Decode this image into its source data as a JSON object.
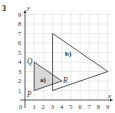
{
  "question_number": "3",
  "axes": {
    "x_label": "x",
    "y_label": "y",
    "origin_label": "0",
    "x_ticks": [
      "1",
      "2",
      "3",
      "4",
      "5",
      "6",
      "7",
      "8",
      "9"
    ],
    "y_ticks": [
      "1",
      "2",
      "3",
      "4",
      "5",
      "6",
      "7",
      "8",
      "9"
    ],
    "x_range": [
      0,
      9
    ],
    "y_range": [
      0,
      9
    ]
  },
  "shapes": [
    {
      "label": "a)",
      "vertices": [
        {
          "name": "P",
          "x": 1,
          "y": 1
        },
        {
          "name": "Q",
          "x": 1,
          "y": 4
        },
        {
          "name": "R",
          "x": 4,
          "y": 2
        }
      ],
      "fill": "#d9d9d9",
      "stroke": "#333333"
    },
    {
      "label": "b)",
      "vertices": [
        {
          "x": 3,
          "y": 1
        },
        {
          "x": 3,
          "y": 7
        },
        {
          "x": 9,
          "y": 3
        }
      ],
      "fill": "none",
      "stroke": "#333333"
    }
  ],
  "point_labels": {
    "P": "P",
    "Q": "Q",
    "R": "R"
  },
  "colors": {
    "grid": "#cfcfcf",
    "axis": "#333333",
    "shaded": "#d9d9d9"
  }
}
